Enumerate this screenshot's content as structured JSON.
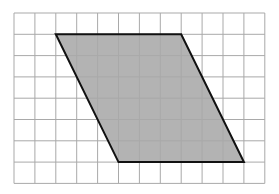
{
  "diagram": {
    "type": "parallelogram-on-grid",
    "grid": {
      "columns": 12,
      "rows": 8,
      "origin_px": [
        14,
        13
      ],
      "cell_width_px": 20.9,
      "cell_height_px": 21.3,
      "line_color": "#a9a9a9"
    },
    "shape": {
      "name": "parallelogram",
      "vertices_grid": [
        [
          2,
          1
        ],
        [
          8,
          1
        ],
        [
          11,
          7
        ],
        [
          5,
          7
        ]
      ],
      "fill": "#b3b3b3",
      "stroke": "#111111",
      "base_units": 6,
      "height_units": 6
    }
  }
}
